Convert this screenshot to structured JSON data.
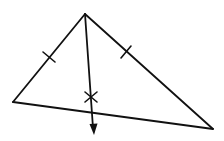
{
  "diagram": {
    "type": "geometry-construction",
    "description": "Triangle with angle bisector from apex; two congruent side tick marks and an X mark on the ray",
    "colors": {
      "stroke": "#111111",
      "background": "#ffffff"
    },
    "vertices": {
      "apex": [
        85,
        14
      ],
      "left": [
        13,
        102
      ],
      "right": [
        213,
        129
      ]
    },
    "ray": {
      "from": [
        85,
        14
      ],
      "to": [
        93,
        133
      ],
      "arrowhead": "arrow-down"
    },
    "tick_marks": [
      {
        "on": "left-side",
        "at": [
          49,
          57
        ]
      },
      {
        "on": "right-side",
        "at": [
          126,
          52
        ]
      }
    ],
    "x_mark": {
      "at": [
        91,
        97
      ]
    },
    "labels": []
  }
}
